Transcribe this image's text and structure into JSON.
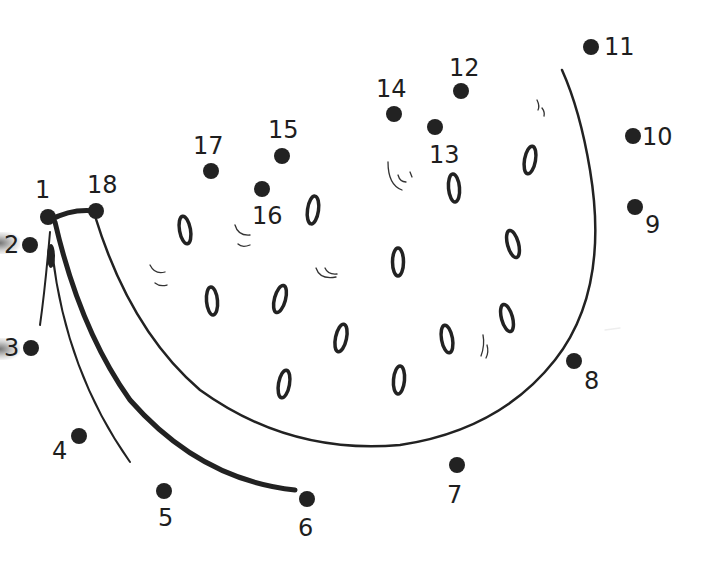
{
  "worksheet": {
    "subject": "watermelon slice",
    "colors": {
      "ink": "#222222",
      "background": "#ffffff"
    },
    "dots": [
      {
        "n": "1",
        "x": 48,
        "y": 217,
        "lx": 35,
        "ly": 198
      },
      {
        "n": "2",
        "x": 30,
        "y": 245,
        "lx": 4,
        "ly": 253
      },
      {
        "n": "3",
        "x": 31,
        "y": 348,
        "lx": 4,
        "ly": 356
      },
      {
        "n": "4",
        "x": 79,
        "y": 436,
        "lx": 52,
        "ly": 459
      },
      {
        "n": "5",
        "x": 164,
        "y": 491,
        "lx": 158,
        "ly": 526
      },
      {
        "n": "6",
        "x": 307,
        "y": 499,
        "lx": 298,
        "ly": 536
      },
      {
        "n": "7",
        "x": 457,
        "y": 465,
        "lx": 447,
        "ly": 503
      },
      {
        "n": "8",
        "x": 574,
        "y": 361,
        "lx": 584,
        "ly": 389
      },
      {
        "n": "9",
        "x": 635,
        "y": 207,
        "lx": 645,
        "ly": 233
      },
      {
        "n": "10",
        "x": 633,
        "y": 136,
        "lx": 642,
        "ly": 145
      },
      {
        "n": "11",
        "x": 591,
        "y": 47,
        "lx": 604,
        "ly": 55
      },
      {
        "n": "12",
        "x": 461,
        "y": 91,
        "lx": 449,
        "ly": 76
      },
      {
        "n": "13",
        "x": 435,
        "y": 127,
        "lx": 429,
        "ly": 163
      },
      {
        "n": "14",
        "x": 394,
        "y": 114,
        "lx": 376,
        "ly": 97
      },
      {
        "n": "15",
        "x": 282,
        "y": 156,
        "lx": 268,
        "ly": 138
      },
      {
        "n": "16",
        "x": 262,
        "y": 189,
        "lx": 252,
        "ly": 224
      },
      {
        "n": "17",
        "x": 211,
        "y": 171,
        "lx": 193,
        "ly": 154
      },
      {
        "n": "18",
        "x": 96,
        "y": 211,
        "lx": 87,
        "ly": 193
      }
    ],
    "seeds": [
      {
        "x": 185,
        "y": 230,
        "r": -10
      },
      {
        "x": 313,
        "y": 210,
        "r": 8
      },
      {
        "x": 454,
        "y": 188,
        "r": -5
      },
      {
        "x": 530,
        "y": 160,
        "r": 10
      },
      {
        "x": 212,
        "y": 301,
        "r": -5
      },
      {
        "x": 280,
        "y": 299,
        "r": 15
      },
      {
        "x": 398,
        "y": 262,
        "r": 0
      },
      {
        "x": 513,
        "y": 244,
        "r": -15
      },
      {
        "x": 341,
        "y": 338,
        "r": 12
      },
      {
        "x": 447,
        "y": 339,
        "r": -10
      },
      {
        "x": 507,
        "y": 318,
        "r": -15
      },
      {
        "x": 284,
        "y": 384,
        "r": 10
      },
      {
        "x": 399,
        "y": 380,
        "r": 5
      }
    ]
  }
}
